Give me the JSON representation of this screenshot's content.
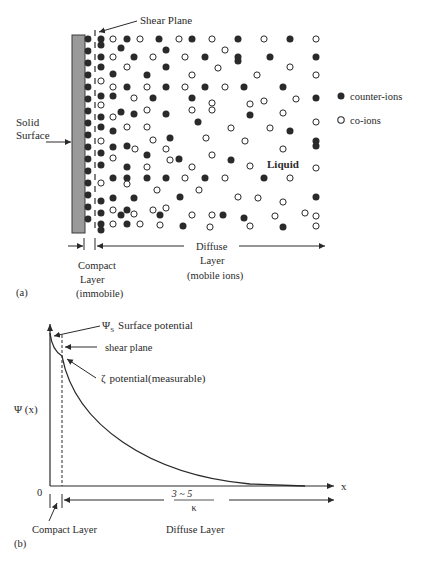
{
  "panel_a": {
    "label": "(a)",
    "shear_plane_label": "Shear Plane",
    "solid_surface_label_line1": "Solid",
    "solid_surface_label_line2": "Surface",
    "liquid_label": "Liquid",
    "legend": [
      {
        "symbol": "filled-circle",
        "label": "counter-ions"
      },
      {
        "symbol": "open-circle",
        "label": "co-ions"
      }
    ],
    "compact_layer_line1": "Compact",
    "compact_layer_line2": "Layer",
    "compact_layer_line3": "(immobile)",
    "diffuse_layer_line1": "Diffuse",
    "diffuse_layer_line2": "Layer",
    "diffuse_layer_line3": "(mobile ions)",
    "colors": {
      "surface_fill": "#9a9a9a",
      "ion_fill": "#2a2a2a"
    }
  },
  "panel_b": {
    "label": "(b)",
    "y_axis_label": "Ψ (x)",
    "x_axis_label": "x",
    "origin_label": "0",
    "surface_potential_symbol": "Ψ",
    "surface_potential_subscript": "S",
    "surface_potential_text": "Surface potential",
    "shear_plane_text": "shear plane",
    "zeta_symbol": "ζ",
    "zeta_text": "potential(measurable)",
    "debye_numerator": "3 ~ 5",
    "debye_denominator": "κ",
    "compact_layer_label": "Compact Layer",
    "diffuse_layer_label": "Diffuse Layer"
  },
  "chart_data": {
    "type": "line",
    "title": "",
    "xlabel": "x",
    "ylabel": "Ψ (x)",
    "series": [
      {
        "name": "Ψ(x) potential profile",
        "x": [
          0,
          0.01,
          0.03,
          0.05,
          0.1,
          0.2,
          0.3,
          0.4,
          0.5,
          0.6,
          0.7,
          0.8,
          0.9,
          1.0
        ],
        "values": [
          1.0,
          0.93,
          0.86,
          0.84,
          0.7,
          0.5,
          0.35,
          0.24,
          0.15,
          0.09,
          0.05,
          0.02,
          0.005,
          0.0
        ]
      }
    ],
    "annotations": [
      "ΨS Surface potential",
      "shear plane",
      "ζ potential(measurable)",
      "3~5 / κ",
      "Compact Layer",
      "Diffuse Layer"
    ],
    "grid": false
  }
}
